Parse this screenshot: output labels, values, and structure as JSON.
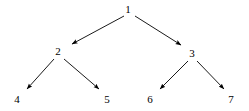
{
  "figure": {
    "name": "binary-tree-diagram",
    "background_color": "#ffffff",
    "stroke_color": "#000000",
    "text_color": "#000000",
    "width": 249,
    "height": 111
  },
  "chart_data": {
    "type": "diagram",
    "diagram_kind": "directed-tree",
    "title": "",
    "xlabel": "",
    "ylabel": "",
    "nodes": [
      {
        "id": "n1",
        "label": "1",
        "x": 128,
        "y": 9,
        "level": 0
      },
      {
        "id": "n2",
        "label": "2",
        "x": 58,
        "y": 51,
        "level": 1
      },
      {
        "id": "n3",
        "label": "3",
        "x": 192,
        "y": 53,
        "level": 1
      },
      {
        "id": "n4",
        "label": "4",
        "x": 17,
        "y": 99,
        "level": 2
      },
      {
        "id": "n5",
        "label": "5",
        "x": 107,
        "y": 99,
        "level": 2
      },
      {
        "id": "n6",
        "label": "6",
        "x": 150,
        "y": 99,
        "level": 2
      },
      {
        "id": "n7",
        "label": "7",
        "x": 231,
        "y": 99,
        "level": 2
      }
    ],
    "edges": [
      {
        "id": "e1",
        "from": "n1",
        "to": "n2",
        "x1": 124,
        "y1": 16,
        "x2": 72,
        "y2": 44,
        "arrow": "filled-triangle"
      },
      {
        "id": "e2",
        "from": "n1",
        "to": "n3",
        "x1": 135,
        "y1": 16,
        "x2": 181,
        "y2": 45,
        "arrow": "filled-triangle"
      },
      {
        "id": "e3",
        "from": "n2",
        "to": "n4",
        "x1": 54,
        "y1": 59,
        "x2": 27,
        "y2": 89,
        "arrow": "filled-triangle"
      },
      {
        "id": "e4",
        "from": "n2",
        "to": "n5",
        "x1": 64,
        "y1": 59,
        "x2": 99,
        "y2": 89,
        "arrow": "filled-triangle"
      },
      {
        "id": "e5",
        "from": "n3",
        "to": "n6",
        "x1": 188,
        "y1": 61,
        "x2": 160,
        "y2": 89,
        "arrow": "filled-triangle"
      },
      {
        "id": "e6",
        "from": "n3",
        "to": "n7",
        "x1": 197,
        "y1": 61,
        "x2": 224,
        "y2": 89,
        "arrow": "filled-triangle"
      }
    ]
  }
}
